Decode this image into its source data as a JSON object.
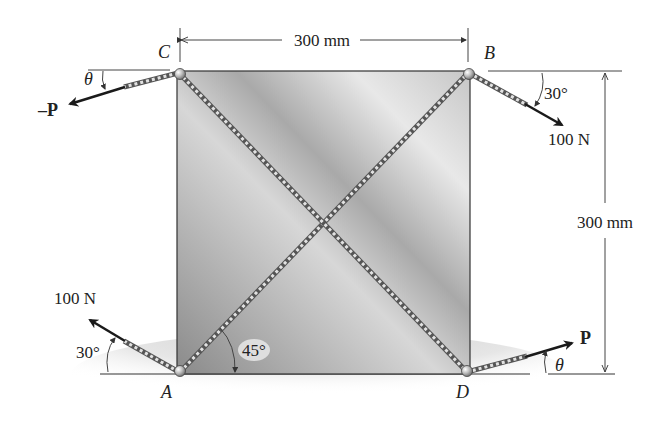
{
  "figure": {
    "type": "statics-free-body-diagram",
    "plate": {
      "width_label": "300 mm",
      "height_label": "300 mm"
    },
    "points": {
      "A": "A",
      "B": "B",
      "C": "C",
      "D": "D"
    },
    "forces": {
      "at_A": {
        "label": "100 N",
        "angle_label": "30°"
      },
      "at_B": {
        "label": "100 N",
        "angle_label": "30°"
      },
      "at_C": {
        "label": "–P",
        "angle_label": "θ"
      },
      "at_D": {
        "label": "P",
        "angle_label": "θ"
      }
    },
    "cable_angle_label": "45°",
    "dimensions": {
      "top": "300 mm",
      "right": "300 mm"
    }
  },
  "colors": {
    "plate_light": "#e6e6e6",
    "plate_dark": "#8f8f8f",
    "line": "#333333",
    "arrow": "#1a1a1a",
    "ground_shadow": "#d9d9d9"
  }
}
